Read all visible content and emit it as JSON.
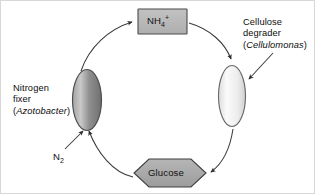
{
  "diagram": {
    "background_color": "#ffffff",
    "line_color": "#3a3a3a",
    "text_color": "#101010",
    "nodes": {
      "ammonium_box": {
        "label_html": "NH<sub>4</sub><sup>+</sup>",
        "label_text": "NH4+",
        "shape": "rectangle",
        "fill_color": "#b4b4b4",
        "stroke_color": "#4a4a4a"
      },
      "glucose_hexagon": {
        "label": "Glucose",
        "shape": "hexagon",
        "fill_color": "#a8a8a8",
        "stroke_color": "#3f3f3f"
      },
      "nitrogen_fixer_cell": {
        "shape": "ellipse",
        "fill_color": "#8a8a8a",
        "stroke_color": "#4a4a4a"
      },
      "cellulose_degrader_cell": {
        "shape": "ellipse",
        "fill_color": "#f2f2f2",
        "stroke_color": "#6a6a6a"
      }
    },
    "labels": {
      "nitrogen_fixer": {
        "line1": "Nitrogen",
        "line2": "fixer",
        "line3_open": "(",
        "line3_genus": "Azotobacter",
        "line3_close": ")"
      },
      "cellulose_degrader": {
        "line1": "Cellulose",
        "line2": "degrader",
        "line3_open": "(",
        "line3_genus": "Cellulomonas",
        "line3_close": ")"
      },
      "n2_input": {
        "text": "N",
        "subscript": "2"
      }
    },
    "arrows": [
      {
        "name": "nitrogen-fixer-to-ammonium",
        "from": "nitrogen_fixer_cell",
        "to": "ammonium_box"
      },
      {
        "name": "ammonium-to-cellulose-degrader",
        "from": "ammonium_box",
        "to": "cellulose_degrader_cell"
      },
      {
        "name": "cellulose-degrader-to-glucose",
        "from": "cellulose_degrader_cell",
        "to": "glucose_hexagon"
      },
      {
        "name": "glucose-to-nitrogen-fixer",
        "from": "glucose_hexagon",
        "to": "nitrogen_fixer_cell"
      },
      {
        "name": "n2-input-to-nitrogen-fixer",
        "from": "n2_input",
        "to": "nitrogen_fixer_cell"
      }
    ],
    "leader_lines": [
      {
        "name": "cellulose-degrader-label-pointer",
        "from": "cellulose_degrader_label",
        "to": "cellulose_degrader_cell"
      }
    ]
  }
}
